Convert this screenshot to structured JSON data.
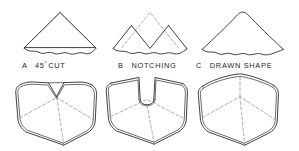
{
  "figure": {
    "background_color": "#ffffff",
    "stroke_color": "#2b2b2b",
    "dashed_color": "#8a8a8a",
    "captions": [
      {
        "key": "a",
        "prefix": "A",
        "text": "45",
        "sup": "°",
        "suffix": "CUT",
        "full": "A  45° CUT"
      },
      {
        "key": "b",
        "prefix": "B",
        "text": "NOTCHING",
        "full": "B  NOTCHING"
      },
      {
        "key": "c",
        "prefix": "C",
        "text": "DRAWN SHAPE",
        "full": "C  DRAWN SHAPE"
      }
    ],
    "rows": [
      {
        "name": "flat-pattern-row",
        "items": [
          {
            "key": "a",
            "label": "45-degree-cut-pattern",
            "description": "Triangular blank with straight 45 degree cut and wavy torn bottom edge, dashed apex construction lines"
          },
          {
            "key": "b",
            "label": "notching-pattern",
            "description": "Triangular blank with V notch removed at centre, dashed apex construction lines"
          },
          {
            "key": "c",
            "label": "drawn-shape-pattern",
            "description": "Triangular blank with rounded drawn apex and wavy bottom edge"
          }
        ]
      },
      {
        "name": "formed-part-row",
        "items": [
          {
            "key": "a",
            "label": "formed-part-45-degree-cut",
            "description": "Formed tray with mitred corner meeting at a point"
          },
          {
            "key": "b",
            "label": "formed-part-notched",
            "description": "Formed tray with open U shaped slot at the corner"
          },
          {
            "key": "c",
            "label": "formed-part-drawn",
            "description": "Formed tray with smooth drawn corner and dashed corner line"
          }
        ]
      }
    ]
  }
}
